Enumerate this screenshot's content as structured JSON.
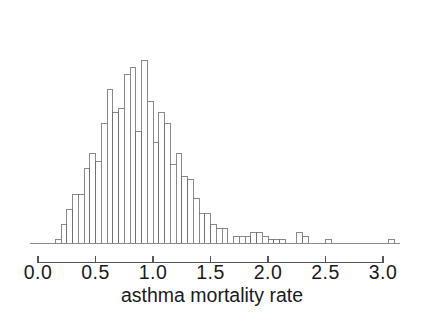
{
  "chart_data": {
    "type": "bar",
    "subtype": "histogram",
    "title": "",
    "subtitle": "",
    "xlabel": "asthma mortality rate",
    "ylabel": "",
    "xlim": [
      0.0,
      3.15
    ],
    "ylim": [
      0,
      60
    ],
    "grid": false,
    "legend": null,
    "bin_width": 0.05,
    "x_tick_labels": [
      "0.0",
      "0.5",
      "1.0",
      "1.5",
      "2.0",
      "2.5",
      "3.0"
    ],
    "x_ticks": [
      0.0,
      0.5,
      1.0,
      1.5,
      2.0,
      2.5,
      3.0
    ],
    "y_axis_visible": false,
    "bin_starts": [
      0.15,
      0.2,
      0.25,
      0.3,
      0.35,
      0.4,
      0.45,
      0.5,
      0.55,
      0.6,
      0.65,
      0.7,
      0.75,
      0.8,
      0.85,
      0.9,
      0.95,
      1.0,
      1.05,
      1.1,
      1.15,
      1.2,
      1.25,
      1.3,
      1.35,
      1.4,
      1.45,
      1.5,
      1.55,
      1.6,
      1.65,
      1.7,
      1.75,
      1.8,
      1.85,
      1.9,
      1.95,
      2.0,
      2.05,
      2.1,
      2.15,
      2.25,
      2.3,
      2.5,
      3.05
    ],
    "counts": [
      1,
      5,
      9,
      13,
      13,
      20,
      24,
      22,
      32,
      41,
      35,
      36,
      45,
      47,
      30,
      49,
      38,
      27,
      35,
      32,
      21,
      24,
      18,
      17,
      12,
      8,
      8,
      5,
      4,
      4,
      0,
      2,
      2,
      2,
      3,
      3,
      2,
      1,
      1,
      1,
      0,
      3,
      2,
      1,
      1
    ],
    "colors": {
      "bar_fill": "#ffffff",
      "bar_stroke": "#6b6b6b",
      "axis": "#555555",
      "text": "#1a1a1a",
      "background": "#ffffff"
    }
  },
  "axis": {
    "label": "asthma mortality rate",
    "ticks": [
      {
        "value": 0.0,
        "label": "0.0"
      },
      {
        "value": 0.5,
        "label": "0.5"
      },
      {
        "value": 1.0,
        "label": "1.0"
      },
      {
        "value": 1.5,
        "label": "1.5"
      },
      {
        "value": 2.0,
        "label": "2.0"
      },
      {
        "value": 2.5,
        "label": "2.5"
      },
      {
        "value": 3.0,
        "label": "3.0"
      }
    ]
  }
}
